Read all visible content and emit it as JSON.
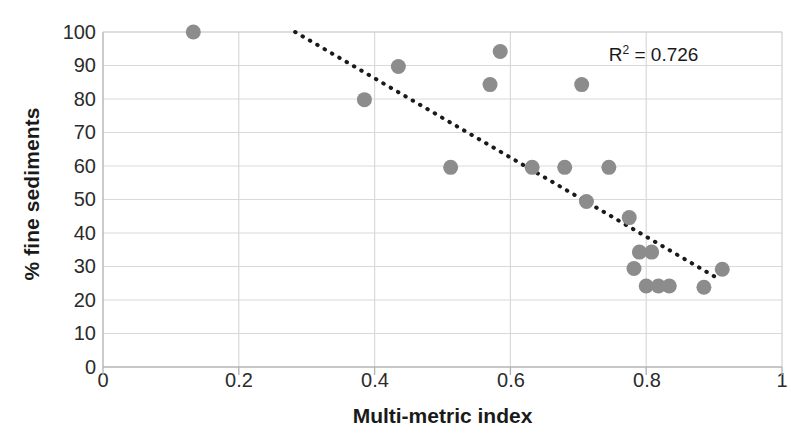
{
  "chart_data": {
    "type": "scatter",
    "title": "",
    "xlabel": "Multi-metric index",
    "ylabel": "% fine sediments",
    "xlim": [
      0,
      1
    ],
    "ylim": [
      0,
      100
    ],
    "xticks": [
      "0",
      "0.2",
      "0.4",
      "0.6",
      "0.8",
      "1"
    ],
    "xtick_values": [
      0,
      0.2,
      0.4,
      0.6,
      0.8,
      1
    ],
    "yticks": [
      "0",
      "10",
      "20",
      "30",
      "40",
      "50",
      "60",
      "70",
      "80",
      "90",
      "100"
    ],
    "ytick_values": [
      0,
      10,
      20,
      30,
      40,
      50,
      60,
      70,
      80,
      90,
      100
    ],
    "grid": "horizontal-and-vertical",
    "legend": "none",
    "marker_color": "#8c8c8c",
    "marker_size": 15,
    "points": [
      {
        "x": 0.133,
        "y": 100
      },
      {
        "x": 0.385,
        "y": 79.8
      },
      {
        "x": 0.435,
        "y": 89.7
      },
      {
        "x": 0.512,
        "y": 59.6
      },
      {
        "x": 0.57,
        "y": 84.3
      },
      {
        "x": 0.585,
        "y": 94.2
      },
      {
        "x": 0.632,
        "y": 59.6
      },
      {
        "x": 0.68,
        "y": 59.6
      },
      {
        "x": 0.705,
        "y": 84.3
      },
      {
        "x": 0.712,
        "y": 49.4
      },
      {
        "x": 0.745,
        "y": 59.6
      },
      {
        "x": 0.775,
        "y": 44.6
      },
      {
        "x": 0.782,
        "y": 29.4
      },
      {
        "x": 0.79,
        "y": 34.3
      },
      {
        "x": 0.808,
        "y": 34.3
      },
      {
        "x": 0.8,
        "y": 24.2
      },
      {
        "x": 0.818,
        "y": 24.2
      },
      {
        "x": 0.834,
        "y": 24.2
      },
      {
        "x": 0.885,
        "y": 23.8
      },
      {
        "x": 0.912,
        "y": 29.2
      }
    ],
    "trendline": {
      "style": "dotted",
      "color": "#1a1a1a",
      "x_start": 0.283,
      "y_start": 100,
      "x_end": 0.905,
      "y_end": 26.5
    },
    "annotations": [
      {
        "name": "r-squared",
        "text": "R",
        "superscript": "2",
        "suffix": " = 0.726",
        "x": 0.845,
        "y": 93
      }
    ]
  },
  "axes": {
    "y_title": "% fine sediments",
    "x_title": "Multi-metric index"
  }
}
